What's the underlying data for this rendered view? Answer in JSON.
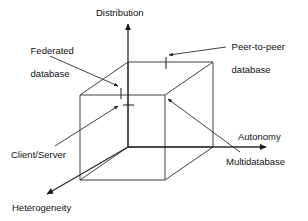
{
  "figure": {
    "type": "3d-classification-cube",
    "background_color": "#ffffff",
    "line_color": "#2b2b2b",
    "text_color": "#111111",
    "width": 308,
    "height": 221
  },
  "axes": [
    {
      "id": "distribution",
      "label": "Distribution",
      "direction": "up",
      "label_x": 96,
      "label_y": 7
    },
    {
      "id": "autonomy",
      "label": "Autonomy",
      "direction": "right",
      "label_x": 238,
      "label_y": 131
    },
    {
      "id": "heterogeneity",
      "label": "Heterogeneity",
      "direction": "down-left",
      "label_x": 12,
      "label_y": 202
    }
  ],
  "callouts": [
    {
      "id": "federated-database",
      "line1": "Federated",
      "line2": "database",
      "label_x": 20,
      "label_y": 33
    },
    {
      "id": "peer-to-peer-database",
      "line1": "Peer-to-peer",
      "line2": "database",
      "label_x": 221,
      "label_y": 29
    },
    {
      "id": "client-server",
      "line1": "Client/Server",
      "line2": "",
      "label_x": 11,
      "label_y": 149
    },
    {
      "id": "multidatabase",
      "line1": "Multidatabase",
      "line2": "",
      "label_x": 226,
      "label_y": 156
    }
  ],
  "cube": {
    "front_face": {
      "left": 80,
      "right": 165,
      "top": 95,
      "bottom": 180
    },
    "back_face": {
      "left": 128,
      "right": 213,
      "top": 62,
      "bottom": 147
    }
  }
}
